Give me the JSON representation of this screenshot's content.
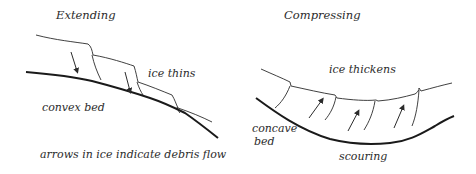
{
  "left_panel": {
    "title": "Extending",
    "ice_label": "ice thins",
    "bed_label": "convex bed",
    "caption": "arrows in ice indicate debris flow"
  },
  "right_panel": {
    "title": "Compressing",
    "ice_label": "ice thickens",
    "bed_label_line1": "concave",
    "bed_label_line2": "bed",
    "bottom_label": "scouring"
  },
  "colors": {
    "ink": "#2b2b2b",
    "background": "#ffffff"
  }
}
